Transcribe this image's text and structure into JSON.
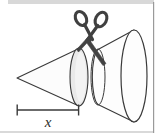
{
  "figure": {
    "background_color": "#ffffff",
    "stroke_color": "#3a3a3a",
    "fill_color": "#fbfbfb",
    "shade_color": "#ededed",
    "scissors_color": "#404040",
    "top_band_color": "#d8d8d8",
    "bottom_rule_color": "#b4b4b4",
    "right_rule_color": "#9a9a9a",
    "labels": {
      "dimension_x": "x"
    },
    "shapes": [
      {
        "name": "left-cone",
        "type": "cone",
        "apex": [
          17,
          78
        ],
        "base_center": [
          79,
          77
        ],
        "base_rx": 9,
        "base_ry": 29
      },
      {
        "name": "right-frustum",
        "type": "frustum",
        "small_center": [
          98,
          77
        ],
        "small_rx": 7,
        "small_ry": 28,
        "large_center": [
          134,
          76
        ],
        "large_rx": 13,
        "large_ry": 46
      },
      {
        "name": "scissors",
        "type": "scissors",
        "pivot": [
          89,
          39
        ],
        "left_handle_center": [
          81,
          18
        ],
        "right_handle_center": [
          101,
          19
        ],
        "blade_tip": [
          105,
          64
        ]
      },
      {
        "name": "dimension-bar",
        "type": "measure",
        "from": [
          17,
          110
        ],
        "to": [
          79,
          110
        ],
        "tick_half_height": 6
      }
    ],
    "dimension_label_position": [
      48,
      126
    ]
  }
}
